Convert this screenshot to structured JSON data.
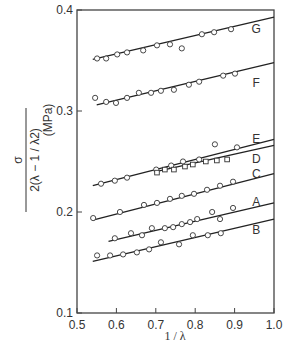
{
  "chart_data": {
    "type": "scatter",
    "title": "",
    "xlabel": "1 / λ",
    "ylabel": {
      "numerator": "σ",
      "denominator": "2(λ − 1 / λ2)",
      "unit": "(MPa)"
    },
    "xlim": [
      0.5,
      1.0
    ],
    "ylim": [
      0.1,
      0.4
    ],
    "x_ticks": [
      "0.5",
      "0.6",
      "0.7",
      "0.8",
      "0.9",
      "1.0"
    ],
    "y_ticks": [
      "0.1",
      "0.2",
      "0.3",
      "0.4"
    ],
    "grid": false,
    "legend": "inline labels at right end of each fit line",
    "series": [
      {
        "name": "G",
        "marker": "circle",
        "x": [
          0.551,
          0.574,
          0.602,
          0.627,
          0.668,
          0.703,
          0.736,
          0.766,
          0.817,
          0.848,
          0.891
        ],
        "y": [
          0.352,
          0.352,
          0.356,
          0.358,
          0.36,
          0.365,
          0.366,
          0.362,
          0.376,
          0.378,
          0.381
        ],
        "fit_line": [
          [
            0.54,
            0.351
          ],
          [
            1.0,
            0.393
          ]
        ],
        "label_pos": [
          0.955,
          0.381
        ]
      },
      {
        "name": "F",
        "marker": "circle",
        "x": [
          0.546,
          0.574,
          0.599,
          0.627,
          0.657,
          0.688,
          0.713,
          0.746,
          0.784,
          0.81,
          0.871,
          0.901
        ],
        "y": [
          0.313,
          0.309,
          0.308,
          0.313,
          0.318,
          0.318,
          0.32,
          0.321,
          0.326,
          0.329,
          0.335,
          0.337
        ],
        "fit_line": [
          [
            0.55,
            0.306
          ],
          [
            1.0,
            0.348
          ]
        ],
        "label_pos": [
          0.955,
          0.328
        ]
      },
      {
        "name": "E",
        "marker": "circle",
        "x": [
          0.561,
          0.596,
          0.627,
          0.701,
          0.739,
          0.769,
          0.81,
          0.85,
          0.906
        ],
        "y": [
          0.228,
          0.231,
          0.234,
          0.242,
          0.246,
          0.25,
          0.252,
          0.267,
          0.264
        ],
        "fit_line": [
          [
            0.54,
            0.226
          ],
          [
            1.0,
            0.272
          ]
        ],
        "label_pos": [
          0.955,
          0.272
        ]
      },
      {
        "name": "D",
        "marker": "square",
        "x": [
          0.703,
          0.723,
          0.746,
          0.774,
          0.794,
          0.827,
          0.855,
          0.881
        ],
        "y": [
          0.239,
          0.242,
          0.242,
          0.245,
          0.247,
          0.25,
          0.251,
          0.252
        ],
        "fit_line": [
          [
            0.7,
            0.24
          ],
          [
            1.0,
            0.266
          ]
        ],
        "label_pos": [
          0.955,
          0.252
        ]
      },
      {
        "name": "C",
        "marker": "circle",
        "x": [
          0.541,
          0.609,
          0.67,
          0.703,
          0.736,
          0.766,
          0.797,
          0.83,
          0.863,
          0.896
        ],
        "y": [
          0.194,
          0.2,
          0.207,
          0.209,
          0.213,
          0.216,
          0.218,
          0.222,
          0.226,
          0.23
        ],
        "fit_line": [
          [
            0.54,
            0.192
          ],
          [
            1.0,
            0.238
          ]
        ],
        "label_pos": [
          0.955,
          0.238
        ]
      },
      {
        "name": "A",
        "marker": "circle",
        "x": [
          0.596,
          0.637,
          0.665,
          0.69,
          0.723,
          0.744,
          0.766,
          0.787,
          0.805,
          0.843,
          0.863,
          0.896
        ],
        "y": [
          0.174,
          0.179,
          0.177,
          0.184,
          0.184,
          0.185,
          0.188,
          0.19,
          0.193,
          0.2,
          0.193,
          0.204
        ],
        "fit_line": [
          [
            0.58,
            0.171
          ],
          [
            1.0,
            0.209
          ]
        ],
        "label_pos": [
          0.955,
          0.21
        ]
      },
      {
        "name": "B",
        "marker": "circle",
        "x": [
          0.551,
          0.584,
          0.617,
          0.652,
          0.683,
          0.713,
          0.759,
          0.794,
          0.832,
          0.865
        ],
        "y": [
          0.157,
          0.157,
          0.158,
          0.16,
          0.163,
          0.17,
          0.168,
          0.177,
          0.177,
          0.179
        ],
        "fit_line": [
          [
            0.54,
            0.151
          ],
          [
            1.0,
            0.193
          ]
        ],
        "label_pos": [
          0.955,
          0.182
        ]
      }
    ]
  }
}
